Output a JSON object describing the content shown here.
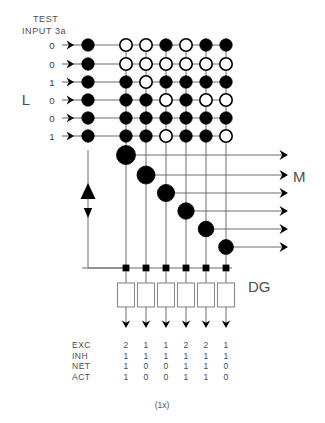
{
  "header": {
    "title_line1": "TEST",
    "title_line2": "INPUT 3a"
  },
  "labels": {
    "layer_l": "L",
    "layer_m": "M",
    "layer_dg": "DG",
    "caption": "(1x)"
  },
  "inputs": {
    "name": "test-input-vector",
    "bits": [
      "0",
      "0",
      "1",
      "0",
      "0",
      "1"
    ]
  },
  "matrix": {
    "name": "L-layer-connection-matrix",
    "rows": 6,
    "cols": 6,
    "legend": {
      "filled": "active connection",
      "open": "inactive connection"
    },
    "input_column_states": [
      1,
      1,
      1,
      1,
      1,
      1
    ],
    "cells": [
      [
        0,
        0,
        1,
        0,
        1,
        1
      ],
      [
        0,
        0,
        0,
        0,
        0,
        0
      ],
      [
        1,
        0,
        1,
        1,
        1,
        1
      ],
      [
        1,
        1,
        0,
        1,
        0,
        0
      ],
      [
        1,
        1,
        1,
        1,
        1,
        1
      ],
      [
        1,
        1,
        0,
        1,
        1,
        0
      ]
    ]
  },
  "m_layer": {
    "name": "M-layer-diagonal-units",
    "count": 6,
    "states": [
      1,
      1,
      1,
      1,
      1,
      1
    ]
  },
  "dg_layer": {
    "name": "DG-layer-units",
    "count": 6,
    "bus_nodes": [
      1,
      1,
      1,
      1,
      1,
      1
    ],
    "box_states": [
      0,
      0,
      0,
      0,
      0,
      0
    ]
  },
  "feedback": {
    "name": "feedback-loop",
    "up_marker": "triangle-up",
    "down_marker": "arrow-down"
  },
  "table": {
    "name": "activation-table",
    "row_labels": [
      "EXC",
      "INH",
      "NET",
      "ACT"
    ],
    "rows": [
      {
        "label": "EXC",
        "values": [
          "2",
          "1",
          "1",
          "2",
          "2",
          "1"
        ]
      },
      {
        "label": "INH",
        "values": [
          "1",
          "1",
          "1",
          "1",
          "1",
          "1"
        ]
      },
      {
        "label": "NET",
        "values": [
          "1",
          "0",
          "0",
          "1",
          "1",
          "0"
        ]
      },
      {
        "label": "ACT",
        "values": [
          "1",
          "0",
          "0",
          "1",
          "1",
          "0"
        ]
      }
    ]
  },
  "colors": {
    "ink": "#000000",
    "wire": "#6e6e6e",
    "text": "#4d4d4d",
    "background": "#ffffff"
  }
}
